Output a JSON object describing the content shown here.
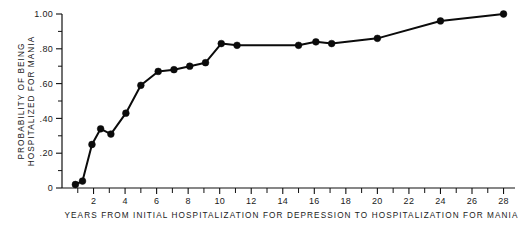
{
  "chart_data": {
    "type": "line",
    "title": "",
    "xlabel": "YEARS FROM INITIAL HOSPITALIZATION FOR DEPRESSION TO HOSPITALIZATION FOR MANIA",
    "ylabel": "PROBABILITY OF BEING HOSPITALIZED FOR MANIA",
    "ylabel_line1": "PROBABILITY OF BEING",
    "ylabel_line2": "HOSPITALIZED FOR MANIA",
    "xlim": [
      0,
      28.6
    ],
    "ylim": [
      0,
      1.0
    ],
    "grid": false,
    "legend": null,
    "markers": "filled-circle",
    "x_tick_labels": [
      "2",
      "4",
      "6",
      "8",
      "10",
      "12",
      "14",
      "16",
      "18",
      "20",
      "22",
      "24",
      "26",
      "28"
    ],
    "x_tick_values": [
      2,
      4,
      6,
      8,
      10,
      12,
      14,
      16,
      18,
      20,
      22,
      24,
      26,
      28
    ],
    "x_minor_tick_values": [
      1,
      3,
      5,
      7,
      9,
      11,
      13,
      15,
      17,
      19,
      21,
      23,
      25,
      27
    ],
    "y_tick_labels": [
      "1.00",
      ".80",
      ".60",
      ".40",
      ".20",
      "0"
    ],
    "y_tick_values": [
      1.0,
      0.8,
      0.6,
      0.4,
      0.2,
      0.0
    ],
    "y_minor_tick_values": [
      0.9,
      0.7,
      0.5,
      0.3,
      0.1
    ],
    "x": [
      0.85,
      1.3,
      1.9,
      2.45,
      3.1,
      4.05,
      5.0,
      6.1,
      7.1,
      8.1,
      9.1,
      10.1,
      11.1,
      15.0,
      16.1,
      17.1,
      20.0,
      24.0,
      28.0
    ],
    "y": [
      0.02,
      0.04,
      0.25,
      0.34,
      0.31,
      0.43,
      0.59,
      0.67,
      0.68,
      0.7,
      0.72,
      0.83,
      0.82,
      0.82,
      0.84,
      0.83,
      0.86,
      0.96,
      1.0
    ],
    "series": [
      {
        "name": "Probability of being hospitalized for mania",
        "points": [
          {
            "x": 0.85,
            "y": 0.02
          },
          {
            "x": 1.3,
            "y": 0.04
          },
          {
            "x": 1.9,
            "y": 0.25
          },
          {
            "x": 2.45,
            "y": 0.34
          },
          {
            "x": 3.1,
            "y": 0.31
          },
          {
            "x": 4.05,
            "y": 0.43
          },
          {
            "x": 5.0,
            "y": 0.59
          },
          {
            "x": 6.1,
            "y": 0.67
          },
          {
            "x": 7.1,
            "y": 0.68
          },
          {
            "x": 8.1,
            "y": 0.7
          },
          {
            "x": 9.1,
            "y": 0.72
          },
          {
            "x": 10.1,
            "y": 0.83
          },
          {
            "x": 11.1,
            "y": 0.82
          },
          {
            "x": 15.0,
            "y": 0.82
          },
          {
            "x": 16.1,
            "y": 0.84
          },
          {
            "x": 17.1,
            "y": 0.83
          },
          {
            "x": 20.0,
            "y": 0.86
          },
          {
            "x": 24.0,
            "y": 0.96
          },
          {
            "x": 28.0,
            "y": 1.0
          }
        ]
      }
    ]
  },
  "geometry": {
    "plot_left": 62,
    "plot_right": 513,
    "plot_top": 14,
    "plot_bottom": 188
  }
}
